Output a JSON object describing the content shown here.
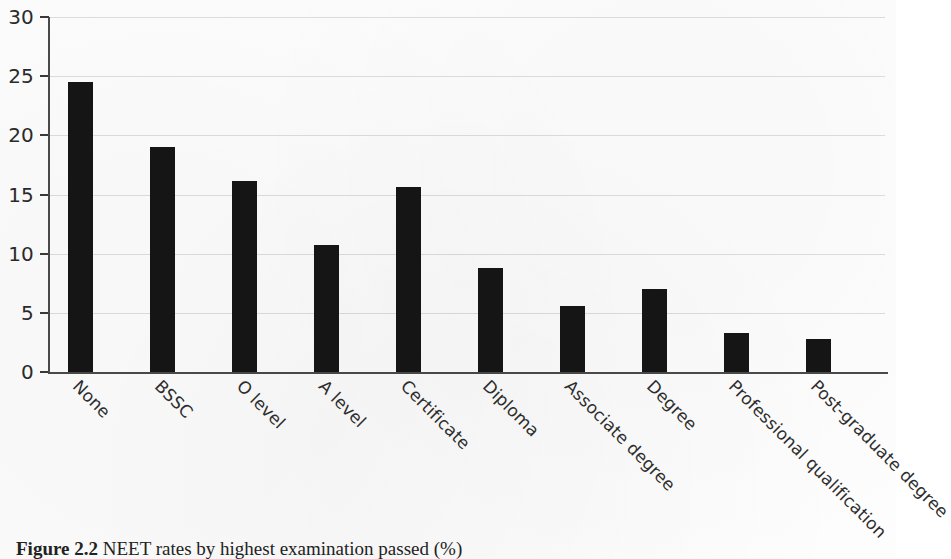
{
  "caption": {
    "figure_number": "Figure 2.2",
    "text": "NEET rates by highest examination passed (%)"
  },
  "chart_data": {
    "type": "bar",
    "title": "",
    "xlabel": "",
    "ylabel": "",
    "ylim": [
      0,
      30
    ],
    "yticks": [
      0,
      5,
      10,
      15,
      20,
      25,
      30
    ],
    "grid": true,
    "legend": "none",
    "bar_color": "#151515",
    "categories": [
      "None",
      "BSSC",
      "O level",
      "A level",
      "Certificate",
      "Diploma",
      "Associate degree",
      "Degree",
      "Professional qualification",
      "Post-graduate degree"
    ],
    "values": [
      24.5,
      19.0,
      16.1,
      10.7,
      15.6,
      8.8,
      5.6,
      7.0,
      3.3,
      2.8
    ]
  }
}
